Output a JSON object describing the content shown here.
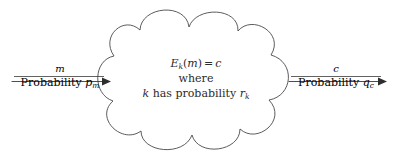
{
  "figure": {
    "type": "cryptosystem-encryption-diagram",
    "background_color": "#ffffff",
    "stroke_color": "#3a3a3a"
  },
  "input_arrow": {
    "name": "plaintext-input-arrow",
    "top_label": "m",
    "bottom_label_text": "Probability",
    "bottom_label_symbol": "p",
    "bottom_label_subscript": "m",
    "direction": "right"
  },
  "output_arrow": {
    "name": "ciphertext-output-arrow",
    "top_label": "c",
    "bottom_label_text": "Probability",
    "bottom_label_symbol": "q",
    "bottom_label_subscript": "c",
    "direction": "right"
  },
  "cloud": {
    "name": "encryption-cloud",
    "lines": [
      {
        "id": "encryption-equation",
        "func": "E",
        "func_subscript": "k",
        "arg_open": "(",
        "arg": "m",
        "arg_close": ")",
        "equals": "=",
        "result": "c"
      },
      {
        "id": "where-keyword",
        "text": "where"
      },
      {
        "id": "key-probability",
        "key": "k",
        "text": "has probability",
        "symbol": "r",
        "subscript": "k"
      }
    ]
  }
}
